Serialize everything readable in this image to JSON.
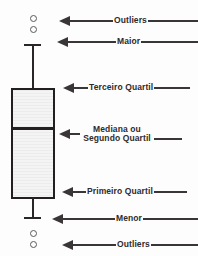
{
  "figure": {
    "language": "pt-BR",
    "background_color": "#fdfdfd",
    "stroke_color": "#231f20",
    "box_fill_color": "#ececed",
    "annotation_color": "#3a3637"
  },
  "annotations": [
    {
      "id": "outliers-top",
      "label": "Outliers"
    },
    {
      "id": "maior",
      "label": "Maior"
    },
    {
      "id": "terceiro",
      "label": "Terceiro Quartil"
    },
    {
      "id": "mediana",
      "label": "Mediana ou Segundo Quartil"
    },
    {
      "id": "primeiro",
      "label": "Primeiro Quartil"
    },
    {
      "id": "menor",
      "label": "Menor"
    },
    {
      "id": "outliers-bot",
      "label": "Outliers"
    }
  ],
  "chart_data": {
    "type": "boxplot",
    "title": "",
    "xlabel": "",
    "ylabel": "",
    "grid": false,
    "legend": "none",
    "orientation": "vertical",
    "series": [
      {
        "name": "Distribuição",
        "maximum_whisker": 44,
        "third_quartile": 88,
        "median": 128,
        "first_quartile": 199,
        "minimum_whisker": 217,
        "outliers_above": [
          15,
          26
        ],
        "outliers_below": [
          230,
          241
        ],
        "units": "pixels (posição vertical na figura)"
      }
    ],
    "part_labels": {
      "outliers_top": "Outliers",
      "maximum": "Maior",
      "q3": "Terceiro Quartil",
      "median_line1": "Mediana ou",
      "median_line2": "Segundo Quartil",
      "q1": "Primeiro Quartil",
      "minimum": "Menor",
      "outliers_bottom": "Outliers"
    }
  }
}
